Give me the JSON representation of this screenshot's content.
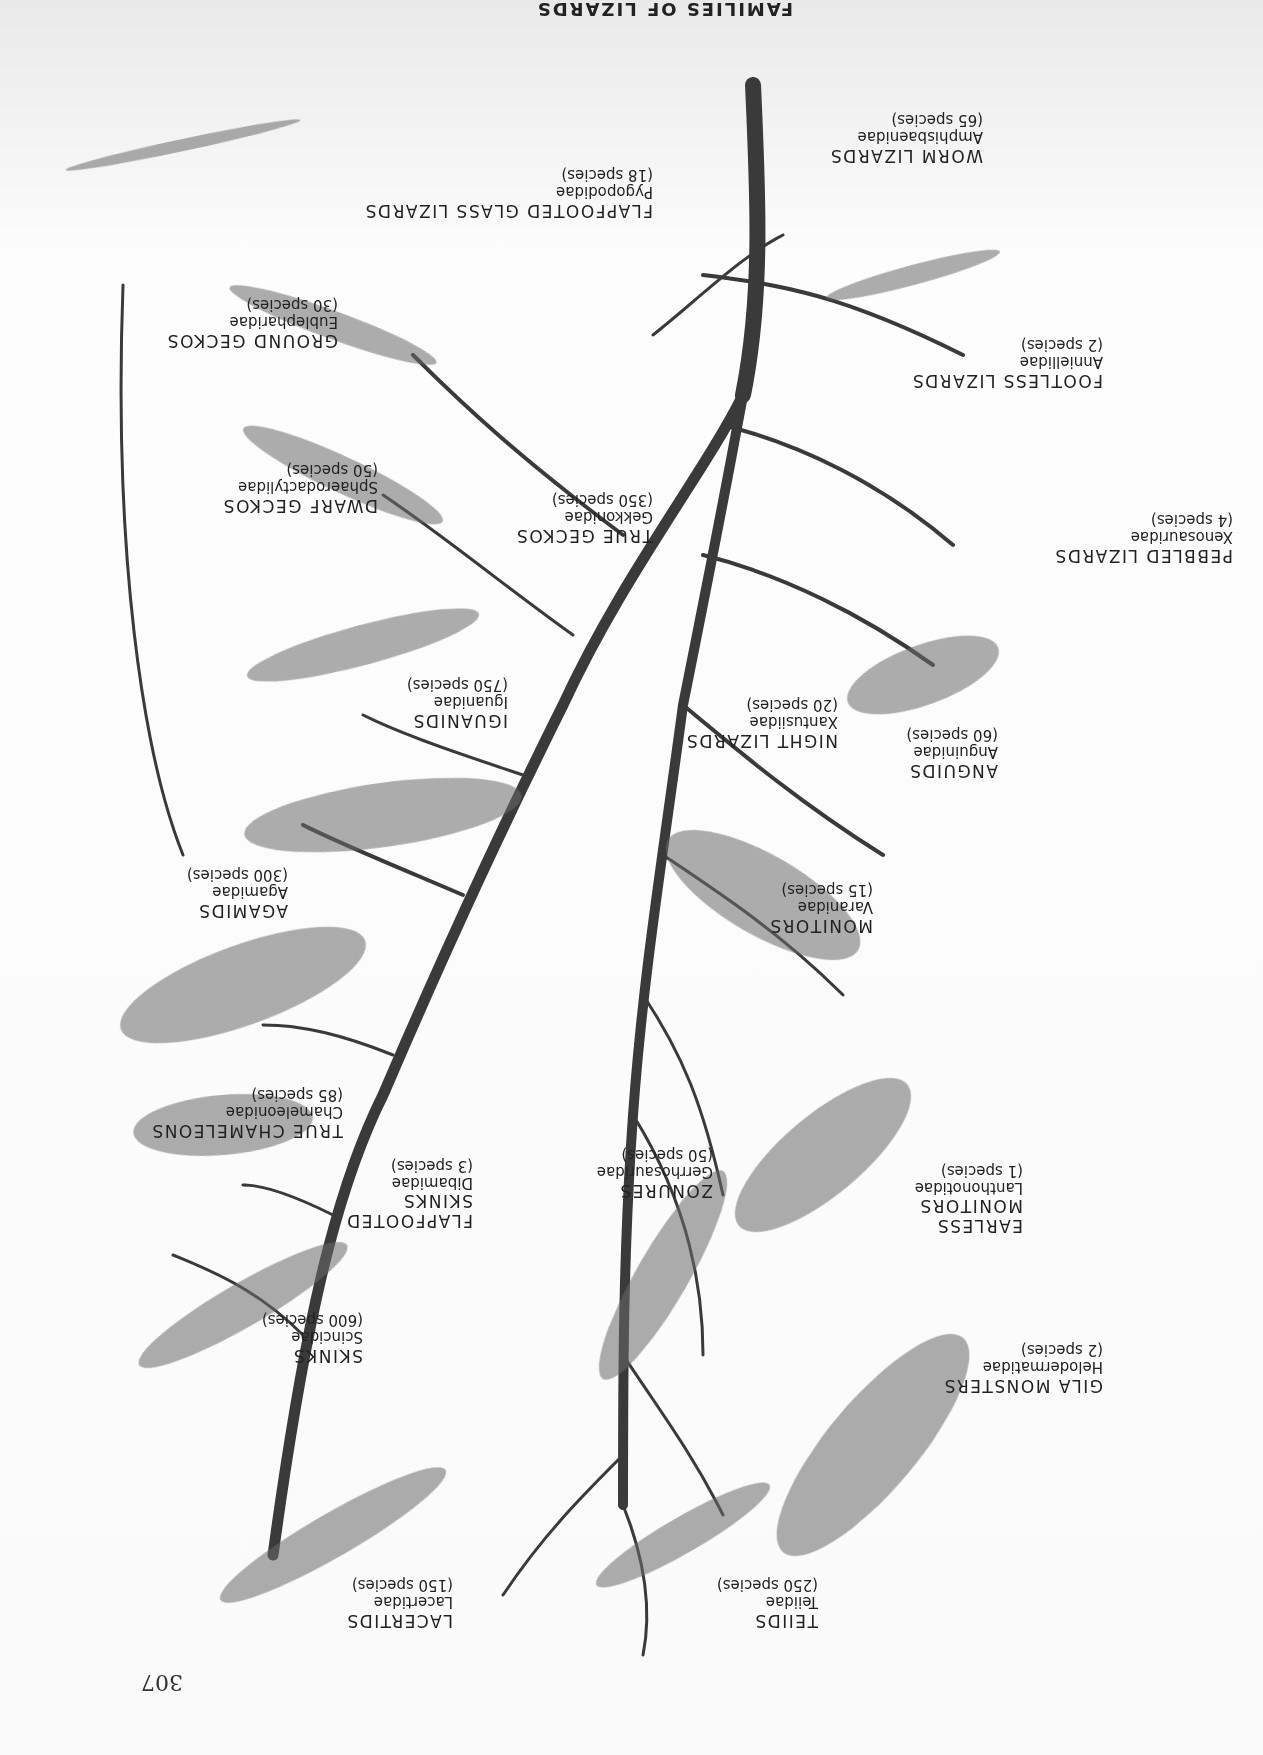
{
  "page": {
    "orientation": "upside-down (rotated 180°)",
    "number": "307",
    "title_partial": "FAMILIES OF LIZARDS"
  },
  "diagram": {
    "type": "family tree of lizards",
    "colors": {
      "branch": "#3a3a3a",
      "text": "#222222",
      "paper": "#fafafa"
    },
    "families": [
      {
        "id": "worm-lizards",
        "common": "WORM LIZARDS",
        "family": "Amphisbaenidae",
        "count": "(65 species)"
      },
      {
        "id": "flapfooted-glass-lizards",
        "common": "FLAPFOOTED GLASS LIZARDS",
        "family": "Pygopodidae",
        "count": "(18 species)"
      },
      {
        "id": "ground-geckos",
        "common": "GROUND GECKOS",
        "family": "Eublepharidae",
        "count": "(30 species)"
      },
      {
        "id": "footless-lizards",
        "common": "FOOTLESS LIZARDS",
        "family": "Anniellidae",
        "count": "(2 species)"
      },
      {
        "id": "dwarf-geckos",
        "common": "DWARF GECKOS",
        "family": "Sphaerodactylidae",
        "count": "(50 species)"
      },
      {
        "id": "true-geckos",
        "common": "TRUE GECKOS",
        "family": "Gekkonidae",
        "count": "(350 species)"
      },
      {
        "id": "pebbled-lizards",
        "common": "PEBBLED LIZARDS",
        "family": "Xenosauridae",
        "count": "(4 species)"
      },
      {
        "id": "iguanids",
        "common": "IGUANIDS",
        "family": "Iguanidae",
        "count": "(750 species)"
      },
      {
        "id": "night-lizards",
        "common": "NIGHT LIZARDS",
        "family": "Xantusiidae",
        "count": "(20 species)"
      },
      {
        "id": "anguids",
        "common": "ANGUIDS",
        "family": "Anguinidae",
        "count": "(60 species)"
      },
      {
        "id": "agamids",
        "common": "AGAMIDS",
        "family": "Agamidae",
        "count": "(300 species)"
      },
      {
        "id": "monitors",
        "common": "MONITORS",
        "family": "Varanidae",
        "count": "(15 species)"
      },
      {
        "id": "true-chameleons",
        "common": "TRUE CHAMELEONS",
        "family": "Chameleonidae",
        "count": "(85 species)"
      },
      {
        "id": "flapfooted-skinks",
        "common": "FLAPFOOTED SKINKS",
        "family": "Dibamidae",
        "count": "(3 species)"
      },
      {
        "id": "zonures",
        "common": "ZONURES",
        "family": "Gerrhosauridae",
        "count": "(50 species)"
      },
      {
        "id": "earless-monitors",
        "common": "EARLESS MONITORS",
        "family": "Lanthonotidae",
        "count": "(1 species)"
      },
      {
        "id": "skinks",
        "common": "SKINKS",
        "family": "Scincidae",
        "count": "(600 species)"
      },
      {
        "id": "gila-monsters",
        "common": "GILA MONSTERS",
        "family": "Helodermatidae",
        "count": "(2 species)"
      },
      {
        "id": "lacertids",
        "common": "LACERTIDS",
        "family": "Lacertidae",
        "count": "(150 species)"
      },
      {
        "id": "teiids",
        "common": "TEIIDS",
        "family": "Teiidae",
        "count": "(250 species)"
      }
    ]
  }
}
